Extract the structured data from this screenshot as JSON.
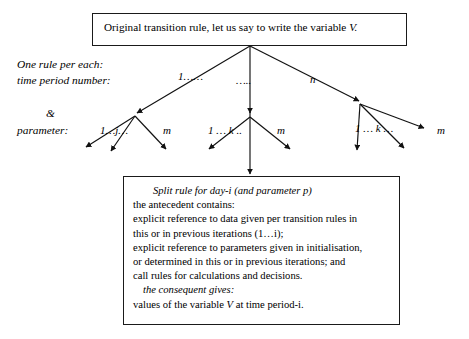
{
  "top_box": {
    "text_prefix": "Original transition rule, let us say to write the variable ",
    "text_var": "V."
  },
  "side_labels": {
    "one_rule": "One rule per each:",
    "time_period": "time period number:",
    "ampersand": "&",
    "parameter": "parameter:"
  },
  "branch_labels": {
    "first": "1……",
    "middle": "…..",
    "last": "n"
  },
  "group_labels": {
    "group1": "1…j…",
    "group1_m": "m",
    "group2": "1 … k ..",
    "group2_m": "m",
    "group3": "1 … k …",
    "group3_m": "m"
  },
  "bottom_box": {
    "title": "Split rule for day-i (and parameter p)",
    "line1": "the antecedent contains:",
    "line2": "explicit reference to data given per transition rules in",
    "line3": "this or in previous iterations (1…i);",
    "line4": "explicit reference to parameters given in initialisation,",
    "line5": "or determined in this or in previous iterations; and",
    "line6": "call rules for calculations and decisions.",
    "consequent_label": "the consequent gives:",
    "line7_prefix": "values of the variable ",
    "line7_var": "V",
    "line7_suffix": " at time period-i."
  },
  "colors": {
    "ink": "#1a1a1a",
    "background": "#ffffff"
  }
}
